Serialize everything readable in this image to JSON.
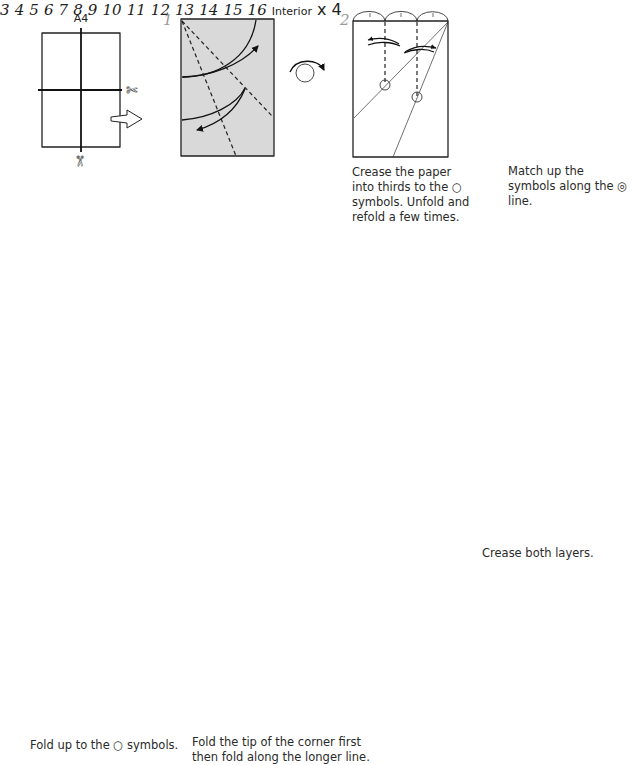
{
  "paper_label": "A4",
  "steps": [
    {
      "number": "1"
    },
    {
      "number": "2"
    },
    {
      "number": "3"
    },
    {
      "number": "4"
    },
    {
      "number": "5"
    },
    {
      "number": "6"
    },
    {
      "number": "7"
    },
    {
      "number": "8"
    },
    {
      "number": "9"
    },
    {
      "number": "10"
    },
    {
      "number": "11"
    },
    {
      "number": "12"
    },
    {
      "number": "13"
    },
    {
      "number": "14"
    },
    {
      "number": "15"
    },
    {
      "number": "16"
    }
  ],
  "captions": {
    "step2": "Crease the paper into thirds to the ○ symbols. Unfold and refold a few times.",
    "step3": "Match up the symbols along the ◎ line.",
    "step12": "Crease both layers.",
    "step13": "Fold up to the ○ symbols.",
    "step14": "Fold the tip of the corner first then fold along the longer line."
  },
  "labels": {
    "interior": "Interior",
    "multiplier": "x 4"
  },
  "symbols": {
    "scissors": "✄",
    "turn_over": "turn-over-icon",
    "rotate": "rotate-icon",
    "valley_fold": "dashed line",
    "mountain_fold": "dash-dot line"
  },
  "colors": {
    "paper_colored": "#d9d9d9",
    "paper_white": "#ffffff",
    "line": "#222222",
    "step_number": "#9a9a9a"
  }
}
